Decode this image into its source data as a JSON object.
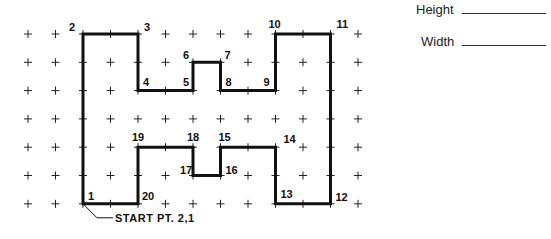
{
  "grid": {
    "cols": 13,
    "rows": 7,
    "x0": 28,
    "dx": 27.5,
    "y0": 34,
    "dy": 28.3,
    "marker": "+"
  },
  "shape": {
    "description": "Letter H outline traced on grid",
    "stroke_color": "#111111",
    "points": [
      {
        "n": "1",
        "c": 2,
        "r": 6,
        "lx": 5,
        "ly": -4
      },
      {
        "n": "2",
        "c": 2,
        "r": 0,
        "lx": -14,
        "ly": -3
      },
      {
        "n": "3",
        "c": 4,
        "r": 0,
        "lx": 6,
        "ly": -3
      },
      {
        "n": "4",
        "c": 4,
        "r": 2,
        "lx": 5,
        "ly": -5
      },
      {
        "n": "5",
        "c": 6,
        "r": 2,
        "lx": -10,
        "ly": -5
      },
      {
        "n": "6",
        "c": 6,
        "r": 1,
        "lx": -10,
        "ly": -3
      },
      {
        "n": "7",
        "c": 7,
        "r": 1,
        "lx": 4,
        "ly": -3
      },
      {
        "n": "8",
        "c": 7,
        "r": 2,
        "lx": 5,
        "ly": -5
      },
      {
        "n": "9",
        "c": 9,
        "r": 2,
        "lx": -12,
        "ly": -5
      },
      {
        "n": "10",
        "c": 9,
        "r": 0,
        "lx": -7,
        "ly": -6
      },
      {
        "n": "11",
        "c": 11,
        "r": 0,
        "lx": 6,
        "ly": -6
      },
      {
        "n": "12",
        "c": 11,
        "r": 6,
        "lx": 5,
        "ly": -3
      },
      {
        "n": "13",
        "c": 9,
        "r": 6,
        "lx": 5,
        "ly": -6
      },
      {
        "n": "14",
        "c": 9,
        "r": 4,
        "lx": 8,
        "ly": -4
      },
      {
        "n": "15",
        "c": 7,
        "r": 4,
        "lx": -2,
        "ly": -6
      },
      {
        "n": "16",
        "c": 7,
        "r": 5,
        "lx": 5,
        "ly": -2
      },
      {
        "n": "17",
        "c": 6,
        "r": 5,
        "lx": -13,
        "ly": -2
      },
      {
        "n": "18",
        "c": 6,
        "r": 4,
        "lx": -6,
        "ly": -6
      },
      {
        "n": "19",
        "c": 4,
        "r": 4,
        "lx": -6,
        "ly": -6
      },
      {
        "n": "20",
        "c": 4,
        "r": 6,
        "lx": 4,
        "ly": -4
      }
    ]
  },
  "start_label": "START PT. 2,1",
  "fields": {
    "height_label": "Height",
    "width_label": "Width"
  }
}
